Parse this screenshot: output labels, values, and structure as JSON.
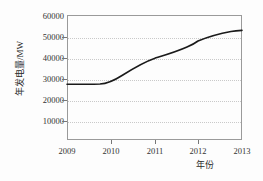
{
  "chart_data": {
    "type": "line",
    "title": "",
    "xlabel": "年份",
    "ylabel": "年发电量/MW",
    "x": [
      2009,
      2010,
      2011,
      2012,
      2013
    ],
    "xticklabels": [
      "2009",
      "2010",
      "2011",
      "2012",
      "2013"
    ],
    "values": [
      25000,
      25000,
      35000,
      40000,
      53000
    ],
    "series": [
      {
        "name": "年发电量",
        "values": [
          25000,
          25000,
          35000,
          40000,
          53000
        ]
      }
    ],
    "yticks": [
      10000,
      20000,
      30000,
      40000,
      50000,
      60000
    ],
    "yticklabels": [
      "10000",
      "20000",
      "30000",
      "40000",
      "50000",
      "60000"
    ],
    "xlim": [
      2009,
      2013
    ],
    "ylim": [
      0,
      60000
    ],
    "grid": "horizontal-dotted",
    "legend": "none",
    "line_color": "#1a1a1a",
    "grid_color": "#c9c9c9",
    "frame_color": "#9a9a9a",
    "background_color": "#fdfdfd",
    "curve_path": "M 67,84.3 C 78,84.3 89,84.3 100,84.0 C 108,83.6 115,80.0 122,75.5 C 133,68.5 144,62.0 155,58.2 C 166,54.8 177,51.5 187,47.0 C 193,44.5 196,42.5 198,41.0 C 209,36.5 220,33.5 231,31.5 C 235,30.9 239,30.6 242,30.4"
  }
}
